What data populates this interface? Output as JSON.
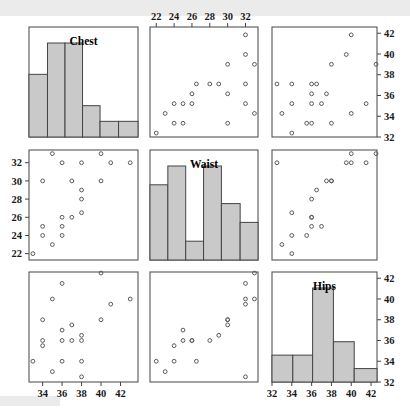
{
  "figure": {
    "type": "scatterplot-matrix",
    "variables": [
      "Chest",
      "Waist",
      "Hips"
    ],
    "diagonal": "histogram",
    "background": "#ffffff",
    "bar_fill": "#c9c9c9",
    "bar_stroke": "#444444",
    "point_stroke": "#5a5a5a",
    "frame_stroke": "#555555"
  },
  "labels": {
    "chest": "Chest",
    "waist": "Waist",
    "hips": "Hips"
  },
  "axes": {
    "chest": {
      "min": 32.6,
      "max": 43.8,
      "ticks": [
        34,
        36,
        38,
        40,
        42
      ],
      "tick_labels": [
        "34",
        "36",
        "38",
        "40",
        "42"
      ]
    },
    "waist": {
      "min": 21.3,
      "max": 33.4,
      "ticks": [
        22,
        24,
        26,
        28,
        30,
        32
      ],
      "tick_labels": [
        "22",
        "24",
        "26",
        "28",
        "30",
        "32"
      ]
    },
    "hips": {
      "min": 32.0,
      "max": 42.6,
      "ticks": [
        32,
        34,
        36,
        38,
        40,
        42
      ],
      "tick_labels": [
        "32",
        "34",
        "36",
        "38",
        "40",
        "42"
      ]
    }
  },
  "axis_placement": {
    "waist_top": "top-middle-panel",
    "hips_right": "right-column-panels",
    "waist_left": "left-column-middle-panel",
    "chest_bottom": "bottom-left-panel",
    "hips_bottom": "bottom-right-panel"
  },
  "chart_data": {
    "type": "scatter",
    "title": "",
    "xlabel": "",
    "ylabel": "",
    "variables": [
      "Chest",
      "Waist",
      "Hips"
    ],
    "n": 20,
    "observations": [
      {
        "chest": 34.0,
        "waist": 30.0,
        "hips": 38.0
      },
      {
        "chest": 33.0,
        "waist": 22.0,
        "hips": 34.0
      },
      {
        "chest": 34.0,
        "waist": 25.0,
        "hips": 36.0
      },
      {
        "chest": 34.0,
        "waist": 24.0,
        "hips": 35.5
      },
      {
        "chest": 35.0,
        "waist": 23.0,
        "hips": 33.0
      },
      {
        "chest": 36.0,
        "waist": 26.0,
        "hips": 36.0
      },
      {
        "chest": 36.0,
        "waist": 25.0,
        "hips": 37.0
      },
      {
        "chest": 36.0,
        "waist": 24.0,
        "hips": 34.0
      },
      {
        "chest": 35.0,
        "waist": 33.0,
        "hips": 40.0
      },
      {
        "chest": 36.0,
        "waist": 32.0,
        "hips": 41.5
      },
      {
        "chest": 37.0,
        "waist": 26.0,
        "hips": 36.0
      },
      {
        "chest": 37.0,
        "waist": 30.0,
        "hips": 37.5
      },
      {
        "chest": 38.0,
        "waist": 29.0,
        "hips": 36.5
      },
      {
        "chest": 38.0,
        "waist": 28.0,
        "hips": 36.0
      },
      {
        "chest": 38.0,
        "waist": 26.5,
        "hips": 34.0
      },
      {
        "chest": 40.0,
        "waist": 33.0,
        "hips": 42.5
      },
      {
        "chest": 41.0,
        "waist": 32.0,
        "hips": 39.5
      },
      {
        "chest": 40.0,
        "waist": 30.0,
        "hips": 38.0
      },
      {
        "chest": 43.0,
        "waist": 32.0,
        "hips": 40.0
      },
      {
        "chest": 38.0,
        "waist": 32.0,
        "hips": 32.5
      }
    ],
    "histograms": {
      "chest": {
        "variable": "Chest",
        "bin_edges": [
          32.6,
          34.5,
          36.3,
          38.1,
          39.9,
          41.8,
          43.8
        ],
        "counts": [
          4,
          6,
          6,
          2,
          1,
          1
        ],
        "max_count": 6
      },
      "waist": {
        "variable": "Waist",
        "bin_edges": [
          21.3,
          23.3,
          25.3,
          27.3,
          29.3,
          31.4,
          33.4
        ],
        "counts": [
          4,
          5,
          1,
          5,
          3,
          2
        ],
        "max_count": 5
      },
      "hips": {
        "variable": "Hips",
        "bin_edges": [
          32.0,
          34.1,
          36.1,
          38.2,
          40.3,
          42.6
        ],
        "counts": [
          2,
          2,
          7,
          3,
          1
        ],
        "max_count": 7
      }
    }
  }
}
